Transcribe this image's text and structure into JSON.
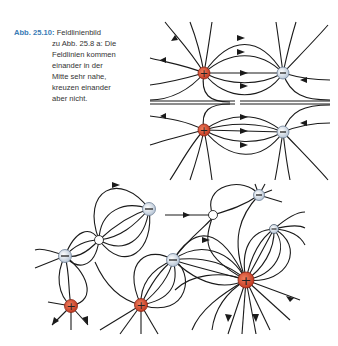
{
  "caption": {
    "label": "Abb. 25.10:",
    "title": "Feldlinienbild",
    "body_lines": [
      "zu Abb. 25.8 a: Die",
      "Feldlinien kommen",
      "einander in der",
      "Mitte sehr nahe,",
      "kreuzen einander",
      "aber nicht."
    ]
  },
  "colors": {
    "positive": "#d9503a",
    "negative": "#dde6f0",
    "line": "#1a1a1a",
    "caption_label": "#3a7bb5"
  },
  "top_diagram": {
    "charges": [
      {
        "sign": "+",
        "x": 204,
        "y": 73
      },
      {
        "sign": "-",
        "x": 283,
        "y": 73
      },
      {
        "sign": "+",
        "x": 204,
        "y": 130
      },
      {
        "sign": "-",
        "x": 283,
        "y": 132
      }
    ]
  },
  "bottom_diagram": {
    "charges": [
      {
        "sign": "-",
        "x": 149,
        "y": 209
      },
      {
        "sign": "0",
        "x": 99,
        "y": 240
      },
      {
        "sign": "-",
        "x": 65,
        "y": 256
      },
      {
        "sign": "-",
        "x": 259,
        "y": 195
      },
      {
        "sign": "0",
        "x": 213,
        "y": 215
      },
      {
        "sign": "-",
        "x": 274,
        "y": 229
      },
      {
        "sign": "-",
        "x": 173,
        "y": 260
      },
      {
        "sign": "+",
        "x": 246,
        "y": 280
      },
      {
        "sign": "+",
        "x": 71,
        "y": 306
      },
      {
        "sign": "+",
        "x": 141,
        "y": 305
      }
    ]
  },
  "symbols": {
    "plus": "+",
    "minus": "−"
  }
}
